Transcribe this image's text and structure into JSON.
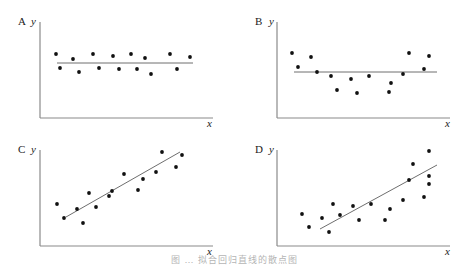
{
  "caption": "图 … 拟合回归直线的散点图",
  "chart_data": [
    {
      "type": "scatter",
      "panel": "A",
      "title": "A",
      "xlabel": "x",
      "ylabel": "y",
      "grid": false,
      "description": "Horizontal fitted line; points scattered evenly above and below (no relationship)",
      "axes": {
        "origin": [
          40,
          118
        ],
        "x_end": 213,
        "y_top": 22
      },
      "points": [
        [
          56,
          54
        ],
        [
          60,
          68
        ],
        [
          73,
          59
        ],
        [
          79,
          72
        ],
        [
          93,
          54
        ],
        [
          99,
          68
        ],
        [
          113,
          56
        ],
        [
          119,
          69
        ],
        [
          131,
          54
        ],
        [
          137,
          69
        ],
        [
          145,
          58
        ],
        [
          151,
          74
        ],
        [
          170,
          54
        ],
        [
          177,
          69
        ],
        [
          190,
          57
        ]
      ],
      "line": [
        [
          57,
          63
        ],
        [
          193,
          63
        ]
      ]
    },
    {
      "type": "scatter",
      "panel": "B",
      "title": "B",
      "xlabel": "x",
      "ylabel": "y",
      "grid": false,
      "description": "Horizontal fitted line; points follow U-shaped (curvilinear) pattern",
      "axes": {
        "origin": [
          277,
          118
        ],
        "x_end": 450,
        "y_top": 22
      },
      "points": [
        [
          292,
          53
        ],
        [
          298,
          67
        ],
        [
          311,
          57
        ],
        [
          317,
          72
        ],
        [
          331,
          76
        ],
        [
          337,
          90
        ],
        [
          351,
          79
        ],
        [
          357,
          93
        ],
        [
          369,
          76
        ],
        [
          389,
          92
        ],
        [
          391,
          83
        ],
        [
          403,
          74
        ],
        [
          409,
          53
        ],
        [
          424,
          69
        ],
        [
          429,
          56
        ]
      ],
      "line": [
        [
          294,
          72
        ],
        [
          437,
          72
        ]
      ]
    },
    {
      "type": "scatter",
      "panel": "C",
      "title": "C",
      "xlabel": "x",
      "ylabel": "y",
      "grid": false,
      "description": "Positive linear trend with roughly constant spread around fitted line",
      "axes": {
        "origin": [
          40,
          246
        ],
        "x_end": 213,
        "y_top": 150
      },
      "points": [
        [
          57,
          204
        ],
        [
          64,
          218
        ],
        [
          77,
          209
        ],
        [
          83,
          223
        ],
        [
          89,
          193
        ],
        [
          96,
          207
        ],
        [
          109,
          196
        ],
        [
          112,
          191
        ],
        [
          124,
          174
        ],
        [
          138,
          190
        ],
        [
          143,
          179
        ],
        [
          156,
          172
        ],
        [
          162,
          152
        ],
        [
          176,
          167
        ],
        [
          182,
          155
        ]
      ],
      "line": [
        [
          66,
          217
        ],
        [
          180,
          152
        ]
      ]
    },
    {
      "type": "scatter",
      "panel": "D",
      "title": "D",
      "xlabel": "x",
      "ylabel": "y",
      "grid": false,
      "description": "Positive linear trend with spread increasing as x increases (heteroscedastic)",
      "axes": {
        "origin": [
          277,
          246
        ],
        "x_end": 450,
        "y_top": 150
      },
      "points": [
        [
          302,
          214
        ],
        [
          309,
          227
        ],
        [
          322,
          218
        ],
        [
          329,
          232
        ],
        [
          333,
          204
        ],
        [
          340,
          215
        ],
        [
          353,
          206
        ],
        [
          359,
          220
        ],
        [
          371,
          204
        ],
        [
          385,
          220
        ],
        [
          390,
          209
        ],
        [
          403,
          200
        ],
        [
          409,
          180
        ],
        [
          413,
          164
        ],
        [
          424,
          197
        ],
        [
          429,
          151
        ],
        [
          429,
          176
        ],
        [
          429,
          184
        ]
      ],
      "line": [
        [
          320,
          229
        ],
        [
          437,
          165
        ]
      ]
    }
  ],
  "labels": {
    "A": {
      "panel": "A",
      "y": "y",
      "x": "x"
    },
    "B": {
      "panel": "B",
      "y": "y",
      "x": "x"
    },
    "C": {
      "panel": "C",
      "y": "y",
      "x": "x"
    },
    "D": {
      "panel": "D",
      "y": "y",
      "x": "x"
    }
  }
}
